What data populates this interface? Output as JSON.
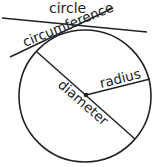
{
  "labels": {
    "title": "circle",
    "circumference": "circumference",
    "radius": "radius",
    "diameter": "diameter"
  },
  "colors": {
    "stroke": "#222222",
    "background": "#ffffff"
  }
}
